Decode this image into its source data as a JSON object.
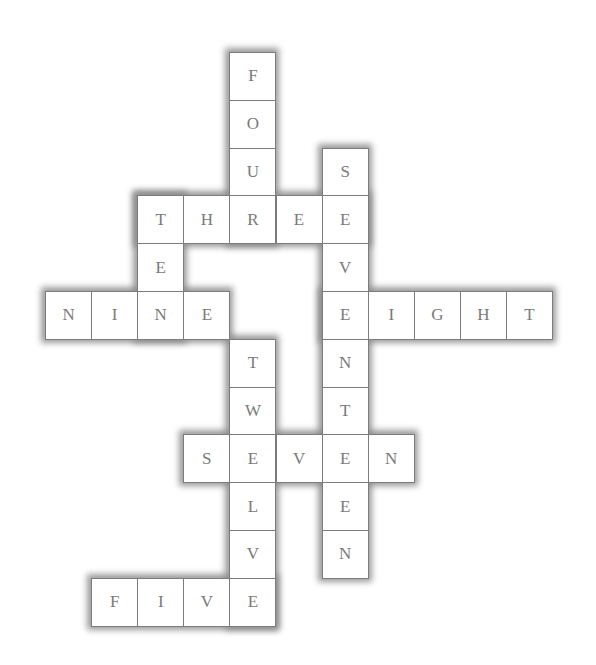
{
  "puzzle": {
    "type": "crossword-number-words",
    "grid": {
      "origin_x": 45,
      "origin_y": 52,
      "cell_w": 46.1,
      "cell_h": 47.8,
      "cols": 11,
      "rows": 12
    },
    "colors": {
      "border": "#7c7c7c",
      "letter": "#7a7a7a",
      "shadow": "#8a8a8a",
      "background": "#ffffff"
    },
    "words": [
      {
        "word": "FOUR",
        "dir": "down",
        "row": 0,
        "col": 4
      },
      {
        "word": "THREE",
        "dir": "across",
        "row": 3,
        "col": 2
      },
      {
        "word": "TEN",
        "dir": "down",
        "row": 3,
        "col": 2
      },
      {
        "word": "SEVENTEEN",
        "dir": "down",
        "row": 2,
        "col": 6
      },
      {
        "word": "NINE",
        "dir": "across",
        "row": 5,
        "col": 0
      },
      {
        "word": "EIGHT",
        "dir": "across",
        "row": 5,
        "col": 6
      },
      {
        "word": "TWELVE",
        "dir": "down",
        "row": 6,
        "col": 4
      },
      {
        "word": "SEVEN",
        "dir": "across",
        "row": 8,
        "col": 3
      },
      {
        "word": "FIVE",
        "dir": "across",
        "row": 11,
        "col": 1
      }
    ]
  }
}
